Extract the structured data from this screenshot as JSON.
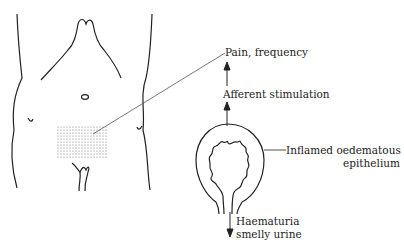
{
  "diagram": {
    "type": "medical-illustration",
    "labels": {
      "pain": "Pain, frequency",
      "afferent": "Afferent stimulation",
      "epithelium_line1": "Inflamed oedematous",
      "epithelium_line2": "epithelium",
      "output_line1": "Haematuria",
      "output_line2": "smelly urine"
    },
    "colors": {
      "line": "#222222",
      "shading": "#888888",
      "background": "#ffffff"
    }
  }
}
